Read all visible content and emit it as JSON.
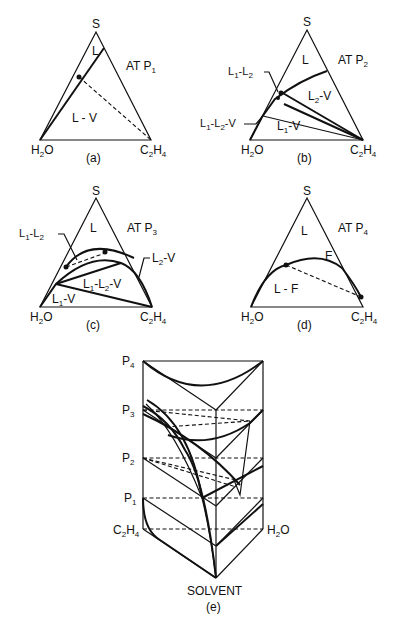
{
  "figure": {
    "panels": [
      {
        "id": "a",
        "caption": "(a)",
        "condition": "AT P",
        "condition_sub": "1",
        "vertices": {
          "top": "S",
          "left": "H",
          "left_sub": "2",
          "left_tail": "O",
          "right": "C",
          "right_sub1": "2",
          "right_mid": "H",
          "right_sub2": "4"
        },
        "regions": [
          "L",
          "L - V"
        ]
      },
      {
        "id": "b",
        "caption": "(b)",
        "condition": "AT P",
        "condition_sub": "2",
        "vertices": {
          "top": "S",
          "left": "H",
          "left_sub": "2",
          "left_tail": "O",
          "right": "C",
          "right_sub1": "2",
          "right_mid": "H",
          "right_sub2": "4"
        },
        "regions": [
          "L",
          "L2-V",
          "L1-V"
        ],
        "callouts": [
          "L1-L2",
          "L1-L2-V"
        ]
      },
      {
        "id": "c",
        "caption": "(c)",
        "condition": "AT P",
        "condition_sub": "3",
        "vertices": {
          "top": "S",
          "left": "H",
          "left_sub": "2",
          "left_tail": "O",
          "right": "C",
          "right_sub1": "2",
          "right_mid": "H",
          "right_sub2": "4"
        },
        "regions": [
          "L",
          "L1-L2-V",
          "L1-V"
        ],
        "callouts": [
          "L1-L2",
          "L2-V"
        ]
      },
      {
        "id": "d",
        "caption": "(d)",
        "condition": "AT P",
        "condition_sub": "4",
        "vertices": {
          "top": "S",
          "left": "H",
          "left_sub": "2",
          "left_tail": "O",
          "right": "C",
          "right_sub1": "2",
          "right_mid": "H",
          "right_sub2": "4"
        },
        "regions": [
          "L",
          "F",
          "L - F"
        ]
      },
      {
        "id": "e",
        "caption": "(e)",
        "pressure_levels": [
          {
            "p": "P",
            "sub": "4"
          },
          {
            "p": "P",
            "sub": "3"
          },
          {
            "p": "P",
            "sub": "2"
          },
          {
            "p": "P",
            "sub": "1"
          }
        ],
        "base_left": {
          "a": "C",
          "s1": "2",
          "b": "H",
          "s2": "4"
        },
        "base_right": {
          "a": "H",
          "s1": "2",
          "b": "O"
        },
        "base_bottom": "SOLVENT"
      }
    ],
    "region_labels": {
      "L": "L",
      "LV": "L - V",
      "L1": "L",
      "L2": "L",
      "one": "1",
      "two": "2",
      "dash": "-",
      "V": "V",
      "F": "F",
      "LF": "L - F"
    }
  }
}
